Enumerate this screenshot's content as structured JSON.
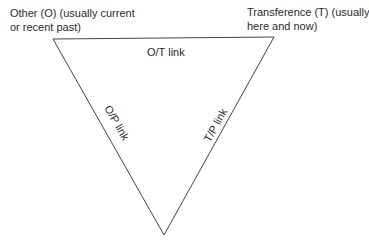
{
  "diagram": {
    "type": "triangle",
    "line_color": "#444444",
    "corners": {
      "other": {
        "line1": "Other (O) (usually current",
        "line2": "or recent past)"
      },
      "transference": {
        "line1": "Transference (T) (usually",
        "line2": "here and now)"
      }
    },
    "edges": {
      "top": "O/T link",
      "left": "O/P link",
      "right": "T/P link"
    }
  }
}
